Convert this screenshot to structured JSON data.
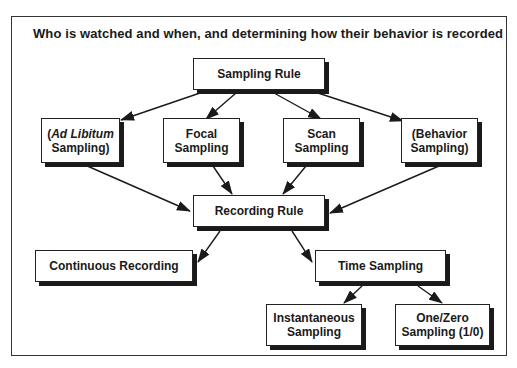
{
  "title": "Who is watched and when, and determining how their behavior is recorded",
  "nodes": {
    "sampling_rule": {
      "label": "Sampling Rule"
    },
    "ad_libitum": {
      "line1_open": "(",
      "line1_italic": "Ad Libitum",
      "line2": "Sampling)"
    },
    "focal": {
      "line1": "Focal",
      "line2": "Sampling"
    },
    "scan": {
      "line1": "Scan",
      "line2": "Sampling"
    },
    "behavior": {
      "line1": "(Behavior",
      "line2": "Sampling)"
    },
    "recording_rule": {
      "label": "Recording Rule"
    },
    "continuous": {
      "label": "Continuous Recording"
    },
    "time_sampling": {
      "label": "Time Sampling"
    },
    "instantaneous": {
      "line1": "Instantaneous",
      "line2": "Sampling"
    },
    "one_zero": {
      "line1": "One/Zero",
      "line2": "Sampling (1/0)"
    }
  },
  "edges": [
    {
      "from": "Sampling Rule",
      "to": "(Ad Libitum Sampling)"
    },
    {
      "from": "Sampling Rule",
      "to": "Focal Sampling"
    },
    {
      "from": "Sampling Rule",
      "to": "Scan Sampling"
    },
    {
      "from": "Sampling Rule",
      "to": "(Behavior Sampling)"
    },
    {
      "from": "(Ad Libitum Sampling)",
      "to": "Recording Rule"
    },
    {
      "from": "Focal Sampling",
      "to": "Recording Rule"
    },
    {
      "from": "Scan Sampling",
      "to": "Recording Rule"
    },
    {
      "from": "(Behavior Sampling)",
      "to": "Recording Rule"
    },
    {
      "from": "Recording Rule",
      "to": "Continuous Recording"
    },
    {
      "from": "Recording Rule",
      "to": "Time Sampling"
    },
    {
      "from": "Time Sampling",
      "to": "Instantaneous Sampling"
    },
    {
      "from": "Time Sampling",
      "to": "One/Zero Sampling (1/0)"
    }
  ],
  "colors": {
    "line": "#1a1a1a",
    "shadow": "#1a1a1a",
    "background": "#ffffff"
  }
}
